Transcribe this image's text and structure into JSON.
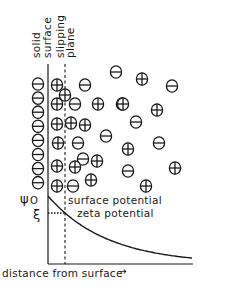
{
  "diagram": {
    "type": "electric-double-layer",
    "labels": {
      "solid_surface_line1": "solid",
      "solid_surface_line2": "surface",
      "slipping_plane_line1": "slipping",
      "slipping_plane_line2": "plane",
      "psi0": "ψ",
      "psi0_subscript": "O",
      "zeta_symbol": "ξ",
      "surface_potential": "surface potential",
      "zeta_potential": "zeta potential",
      "x_axis": "distance from surface",
      "x_axis_arrow": "→"
    },
    "ions": {
      "surface_negative_count": 8,
      "diffuse": [
        {
          "charge": "+",
          "row": 1,
          "col": 1
        },
        {
          "charge": "+",
          "row": 1,
          "col": 2
        },
        {
          "charge": "-",
          "row": 1,
          "col": 3
        },
        {
          "charge": "-",
          "row": 0,
          "col": 4
        },
        {
          "charge": "+",
          "row": 0,
          "col": 5
        },
        {
          "charge": "-",
          "row": 0,
          "col": 6
        },
        {
          "charge": "+",
          "row": 2,
          "col": 1
        },
        {
          "charge": "-",
          "row": 2,
          "col": 2
        },
        {
          "charge": "+",
          "row": 2,
          "col": 3
        },
        {
          "charge": "+",
          "row": 2,
          "col": 4
        },
        {
          "charge": "+",
          "row": 2,
          "col": 5
        },
        {
          "charge": "+",
          "row": 2,
          "col": 6
        },
        {
          "charge": "-",
          "row": 3,
          "col": 5
        },
        {
          "charge": "+",
          "row": 4,
          "col": 1
        },
        {
          "charge": "+",
          "row": 4,
          "col": 2
        },
        {
          "charge": "+",
          "row": 4,
          "col": 3
        },
        {
          "charge": "-",
          "row": 5,
          "col": 4
        },
        {
          "charge": "+",
          "row": 5,
          "col": 1
        },
        {
          "charge": "-",
          "row": 5,
          "col": 2
        },
        {
          "charge": "-",
          "row": 5,
          "col": 5
        },
        {
          "charge": "+",
          "row": 5,
          "col": 6
        },
        {
          "charge": "-",
          "row": 6,
          "col": 2
        },
        {
          "charge": "+",
          "row": 6,
          "col": 3
        },
        {
          "charge": "+",
          "row": 6,
          "col": 1
        },
        {
          "charge": "+",
          "row": 6,
          "col": 4
        },
        {
          "charge": "-",
          "row": 7,
          "col": 4
        },
        {
          "charge": "+",
          "row": 7,
          "col": 6
        },
        {
          "charge": "+",
          "row": 8,
          "col": 1
        },
        {
          "charge": "-",
          "row": 8,
          "col": 2
        },
        {
          "charge": "+",
          "row": 8,
          "col": 3
        },
        {
          "charge": "+",
          "row": 8,
          "col": 5
        }
      ]
    },
    "potential_curve": {
      "shape": "exponential-decay",
      "surface_potential_rel": 1.0,
      "zeta_potential_rel": 0.75
    }
  }
}
